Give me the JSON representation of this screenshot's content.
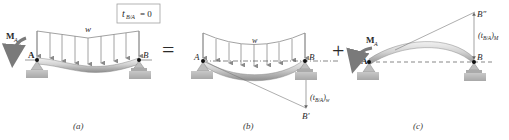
{
  "figure": {
    "panels": [
      {
        "id": "a",
        "caption": "(a)",
        "load_label": "w",
        "moment_label": "M",
        "moment_sub": "A",
        "support_left_label": "A",
        "support_right_label": "B",
        "condition_box": {
          "text": "t",
          "sub": "B/A",
          "rhs": "= 0"
        }
      },
      {
        "id": "b",
        "caption": "(b)",
        "load_label": "w",
        "support_left_label": "A",
        "support_right_label": "B",
        "deflection_point": "B′",
        "deviation_label": "(t",
        "deviation_sub": "B/A",
        "deviation_close": ")",
        "deviation_subscript2": "w"
      },
      {
        "id": "c",
        "caption": "(c)",
        "moment_label": "M",
        "moment_sub": "A",
        "support_left_label": "A",
        "support_right_label": "B",
        "deflection_point": "B″",
        "deviation_label": "(t",
        "deviation_sub": "B/A",
        "deviation_close": ")",
        "deviation_subscript2": "M"
      }
    ],
    "operators": {
      "equals": "=",
      "plus": "+"
    },
    "colors": {
      "beam_light": "#e4e4e4",
      "beam_dark": "#9a9a9a",
      "load_arrows": "#8a8a8a",
      "moment_arrow": "#7a7a7a",
      "ground": "#b8b8b8",
      "lines": "#555555",
      "box_border": "#a0a0a0"
    }
  }
}
